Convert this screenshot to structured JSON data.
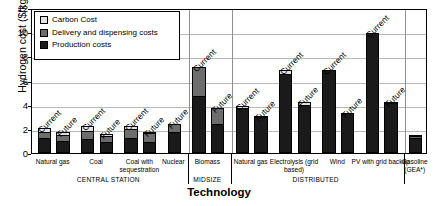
{
  "chart_data": {
    "type": "bar",
    "title": "",
    "xlabel": "Technology",
    "ylabel": "Hydrogen cost ($/kg)",
    "ylim": [
      0,
      12
    ],
    "yticks": [
      0,
      2,
      4,
      6,
      8,
      10,
      12
    ],
    "grid": true,
    "stacked": true,
    "legend_position": "upper-left",
    "legend": [
      {
        "key": "carbon",
        "label": "Carbon Cost",
        "color": "#e3e3e3"
      },
      {
        "key": "delivery",
        "label": "Delivery and dispensing costs",
        "color": "#6d6d6d"
      },
      {
        "key": "production",
        "label": "Production costs",
        "color": "#1a1a1a"
      }
    ],
    "series": [
      {
        "name": "Production costs",
        "key": "production",
        "color": "#1a1a1a"
      },
      {
        "name": "Delivery and dispensing costs",
        "key": "delivery",
        "color": "#6d6d6d"
      },
      {
        "name": "Carbon Cost",
        "key": "carbon",
        "color": "#e3e3e3"
      }
    ],
    "group_bands": [
      {
        "label": "CENTRAL STATION",
        "categories": [
          "Natural gas",
          "Coal",
          "Coal with sequestration",
          "Nuclear"
        ]
      },
      {
        "label": "MIDSIZE",
        "categories": [
          "Biomass"
        ]
      },
      {
        "label": "DISTRIBUTED",
        "categories": [
          "Natural gas",
          "Electrolysis (grid based)",
          "Wind",
          "PV with grid backup"
        ]
      },
      {
        "label": "",
        "categories": [
          "Gasoline (GEA*)"
        ]
      }
    ],
    "categories": [
      {
        "label": "Natural gas",
        "band": "CENTRAL STATION",
        "bars": [
          {
            "scenario": "Current",
            "production": 1.2,
            "delivery": 0.55,
            "carbon": 0.35,
            "total": 2.1
          },
          {
            "scenario": "Future",
            "production": 0.95,
            "delivery": 0.55,
            "carbon": 0.25,
            "total": 1.75
          }
        ]
      },
      {
        "label": "Coal",
        "band": "CENTRAL STATION",
        "bars": [
          {
            "scenario": "Current",
            "production": 1.05,
            "delivery": 0.75,
            "carbon": 0.45,
            "total": 2.25
          },
          {
            "scenario": "Future",
            "production": 0.8,
            "delivery": 0.6,
            "carbon": 0.2,
            "total": 1.6
          }
        ]
      },
      {
        "label": "Coal with sequestration",
        "band": "CENTRAL STATION",
        "bars": [
          {
            "scenario": "Current",
            "production": 1.15,
            "delivery": 0.8,
            "carbon": 0.3,
            "total": 2.25
          },
          {
            "scenario": "Future",
            "production": 0.8,
            "delivery": 0.85,
            "carbon": 0.1,
            "total": 1.75
          }
        ]
      },
      {
        "label": "Nuclear",
        "band": "CENTRAL STATION",
        "bars": [
          {
            "scenario": "Future",
            "production": 1.7,
            "delivery": 0.7,
            "carbon": 0.0,
            "total": 2.4
          }
        ]
      },
      {
        "label": "Biomass",
        "band": "MIDSIZE",
        "bars": [
          {
            "scenario": "Current",
            "production": 4.65,
            "delivery": 2.45,
            "carbon": 0.0,
            "total": 7.1
          },
          {
            "scenario": "Future",
            "production": 2.3,
            "delivery": 1.4,
            "carbon": 0.0,
            "total": 3.7
          }
        ]
      },
      {
        "label": "Natural gas",
        "band": "DISTRIBUTED",
        "bars": [
          {
            "scenario": "Current",
            "production": 3.75,
            "delivery": 0.0,
            "carbon": 0.15,
            "total": 3.9
          },
          {
            "scenario": "Future",
            "production": 2.95,
            "delivery": 0.0,
            "carbon": 0.1,
            "total": 3.05
          }
        ]
      },
      {
        "label": "Electrolysis (grid based)",
        "band": "DISTRIBUTED",
        "bars": [
          {
            "scenario": "Current",
            "production": 6.55,
            "delivery": 0.0,
            "carbon": 0.3,
            "total": 6.85
          },
          {
            "scenario": "Future",
            "production": 3.95,
            "delivery": 0.0,
            "carbon": 0.25,
            "total": 4.2
          }
        ]
      },
      {
        "label": "Wind",
        "band": "DISTRIBUTED",
        "bars": [
          {
            "scenario": "Current",
            "production": 6.9,
            "delivery": 0.0,
            "carbon": 0.0,
            "total": 6.9
          },
          {
            "scenario": "Future",
            "production": 3.3,
            "delivery": 0.0,
            "carbon": 0.0,
            "total": 3.3
          }
        ]
      },
      {
        "label": "PV with grid backup",
        "band": "DISTRIBUTED",
        "bars": [
          {
            "scenario": "Current",
            "production": 9.9,
            "delivery": 0.0,
            "carbon": 0.0,
            "total": 9.9
          },
          {
            "scenario": "Future",
            "production": 4.15,
            "delivery": 0.0,
            "carbon": 0.1,
            "total": 4.25
          }
        ]
      },
      {
        "label": "Gasoline (GEA*)",
        "band": "",
        "bars": [
          {
            "scenario": "",
            "production": 1.2,
            "delivery": 0.18,
            "carbon": 0.12,
            "total": 1.5
          }
        ]
      }
    ]
  }
}
